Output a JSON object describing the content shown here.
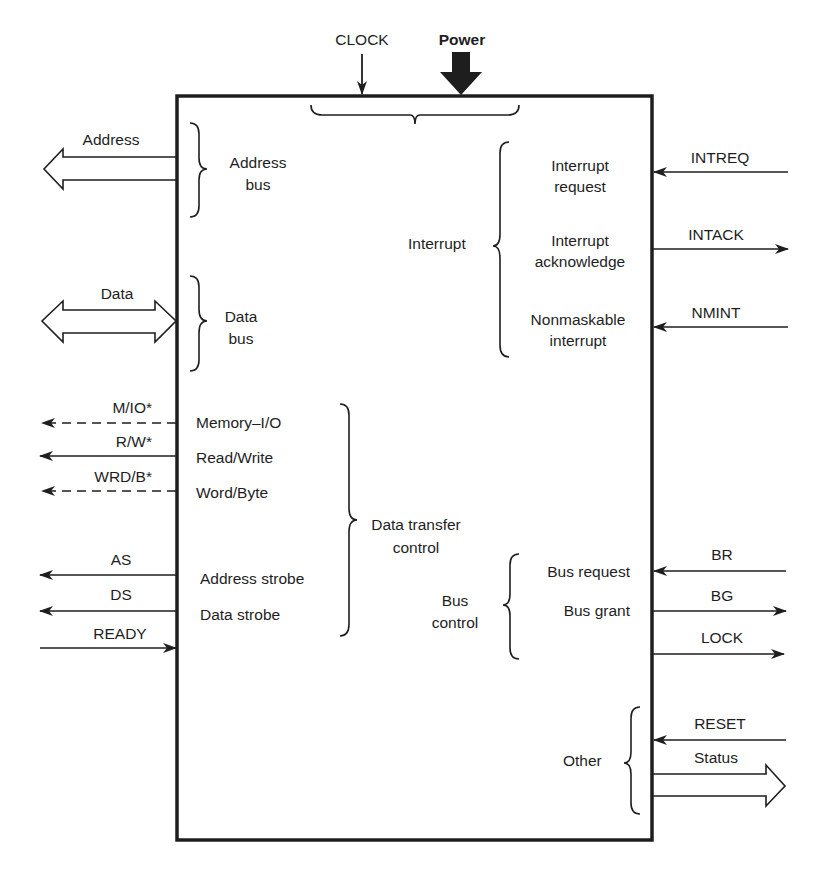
{
  "diagram": {
    "type": "cpu-pinout-block-diagram",
    "ink_color": "#1e1e1e",
    "background": "#ffffff"
  },
  "top_signals": {
    "clock": "CLOCK",
    "power": "Power"
  },
  "left_signals": {
    "address": "Address",
    "data": "Data",
    "m_io": "M/IO*",
    "r_w": "R/W*",
    "wrd_b": "WRD/B*",
    "as": "AS",
    "ds": "DS",
    "ready": "READY"
  },
  "right_signals": {
    "intreq": "INTREQ",
    "intack": "INTACK",
    "nmint": "NMINT",
    "br": "BR",
    "bg": "BG",
    "lock": "LOCK",
    "reset": "RESET",
    "status": "Status"
  },
  "groups": {
    "address_bus": [
      "Address",
      "bus"
    ],
    "data_bus": [
      "Data",
      "bus"
    ],
    "data_transfer_control": [
      "Data transfer",
      "control"
    ],
    "interrupt": "Interrupt",
    "bus_control": [
      "Bus",
      "control"
    ],
    "other": "Other"
  },
  "internal_labels": {
    "memory_io": "Memory–I/O",
    "read_write": "Read/Write",
    "word_byte": "Word/Byte",
    "address_strobe": "Address strobe",
    "data_strobe": "Data strobe",
    "interrupt_request": [
      "Interrupt",
      "request"
    ],
    "interrupt_acknowledge": [
      "Interrupt",
      "acknowledge"
    ],
    "nonmaskable_interrupt": [
      "Nonmaskable",
      "interrupt"
    ],
    "bus_request": "Bus request",
    "bus_grant": "Bus grant"
  }
}
